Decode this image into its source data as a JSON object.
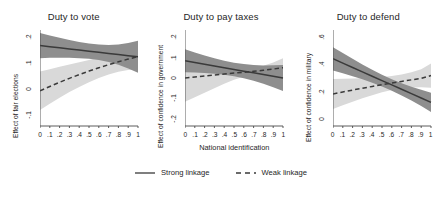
{
  "figure": {
    "xlabel": "National identification",
    "legend": [
      {
        "label": "Strong linkage",
        "style": "solid",
        "color": "#3a3a3a"
      },
      {
        "label": "Weak linkage",
        "style": "dashed",
        "color": "#3a3a3a"
      }
    ]
  },
  "colors": {
    "line": "#3a3a3a",
    "band_strong": "#8e8e8e",
    "band_weak": "#d9d9d9",
    "axis": "#4a4a4a",
    "text": "#262626"
  },
  "chart_data": [
    {
      "type": "line",
      "title": "Duty to vote",
      "xlabel": "",
      "ylabel": "Effect of fair elections",
      "x": [
        0,
        0.1,
        0.2,
        0.3,
        0.4,
        0.5,
        0.6,
        0.7,
        0.8,
        0.9,
        1
      ],
      "xticklabels": [
        "0",
        ".1",
        ".2",
        ".3",
        ".4",
        ".5",
        ".6",
        ".7",
        ".8",
        ".9",
        "1"
      ],
      "xlim": [
        0,
        1
      ],
      "ylim": [
        -0.14,
        0.225
      ],
      "yticks": [
        0.2,
        0.1,
        0,
        -0.1
      ],
      "yticklabels": [
        ".2",
        ".1",
        "0",
        "-.1"
      ],
      "grid": false,
      "series": [
        {
          "name": "Strong linkage",
          "style": "solid",
          "values": [
            0.166,
            0.1617,
            0.1574,
            0.1531,
            0.1488,
            0.1445,
            0.1402,
            0.1359,
            0.1316,
            0.1273,
            0.123
          ],
          "ci_lower": [
            0.118,
            0.1192,
            0.1196,
            0.1192,
            0.118,
            0.1155,
            0.111,
            0.1037,
            0.093,
            0.079,
            0.062
          ],
          "ci_upper": [
            0.214,
            0.2042,
            0.1952,
            0.187,
            0.1796,
            0.1735,
            0.1694,
            0.1681,
            0.1702,
            0.1756,
            0.184
          ]
        },
        {
          "name": "Weak linkage",
          "style": "dashed",
          "values": [
            -0.006,
            0.0104,
            0.0262,
            0.0412,
            0.0554,
            0.0688,
            0.0814,
            0.0932,
            0.1042,
            0.1144,
            0.1238
          ],
          "ci_lower": [
            -0.0795,
            -0.0554,
            -0.0326,
            -0.0112,
            0.0086,
            0.0266,
            0.0424,
            0.0558,
            0.0662,
            0.0732,
            0.0762
          ],
          "ci_upper": [
            0.0675,
            0.0762,
            0.085,
            0.0936,
            0.1022,
            0.111,
            0.1204,
            0.1306,
            0.1422,
            0.1556,
            0.1714
          ]
        }
      ]
    },
    {
      "type": "line",
      "title": "Duty to pay taxes",
      "xlabel": "National identification",
      "ylabel": "Effect of confidence in government",
      "x": [
        0,
        0.1,
        0.2,
        0.3,
        0.4,
        0.5,
        0.6,
        0.7,
        0.8,
        0.9,
        1
      ],
      "xticklabels": [
        "0",
        ".1",
        ".2",
        ".3",
        ".4",
        ".5",
        ".6",
        ".7",
        ".8",
        ".9",
        "1"
      ],
      "xlim": [
        0,
        1
      ],
      "ylim": [
        -0.235,
        0.235
      ],
      "yticks": [
        0.2,
        0.1,
        0,
        -0.1,
        -0.2
      ],
      "yticklabels": [
        ".2",
        ".1",
        "0",
        "-.1",
        "-.2"
      ],
      "grid": false,
      "series": [
        {
          "name": "Strong linkage",
          "style": "solid",
          "values": [
            0.084,
            0.0756,
            0.0672,
            0.0588,
            0.0504,
            0.042,
            0.0336,
            0.0252,
            0.0168,
            0.0084,
            0.0
          ],
          "ci_lower": [
            0.0276,
            0.0264,
            0.0242,
            0.0208,
            0.0158,
            0.0088,
            -0.0008,
            -0.0132,
            -0.0282,
            -0.0452,
            -0.0636
          ],
          "ci_upper": [
            0.1404,
            0.1248,
            0.1102,
            0.0968,
            0.085,
            0.0752,
            0.068,
            0.0636,
            0.0618,
            0.062,
            0.0636
          ]
        },
        {
          "name": "Weak linkage",
          "style": "dashed",
          "values": [
            0.0,
            0.0052,
            0.0102,
            0.015,
            0.0196,
            0.024,
            0.0282,
            0.0326,
            0.0378,
            0.0438,
            0.0504
          ],
          "ci_lower": [
            -0.1166,
            -0.0942,
            -0.0718,
            -0.0496,
            -0.0282,
            -0.0086,
            0.0064,
            0.0148,
            0.0162,
            0.0122,
            0.0046
          ],
          "ci_upper": [
            0.1166,
            0.1046,
            0.0922,
            0.0796,
            0.0674,
            0.0566,
            0.05,
            0.0504,
            0.0594,
            0.0754,
            0.0962
          ]
        }
      ]
    },
    {
      "type": "line",
      "title": "Duty to defend",
      "xlabel": "",
      "ylabel": "Effect of confidence in military",
      "x": [
        0,
        0.1,
        0.2,
        0.3,
        0.4,
        0.5,
        0.6,
        0.7,
        0.8,
        0.9,
        1
      ],
      "xticklabels": [
        "0",
        ".1",
        ".2",
        ".3",
        ".4",
        ".5",
        ".6",
        ".7",
        ".8",
        ".9",
        "1"
      ],
      "xlim": [
        0,
        1
      ],
      "ylim": [
        -0.055,
        0.655
      ],
      "yticks": [
        0.6,
        0.4,
        0.2,
        0
      ],
      "yticklabels": [
        ".6",
        ".4",
        ".2",
        "0"
      ],
      "grid": false,
      "series": [
        {
          "name": "Strong linkage",
          "style": "solid",
          "values": [
            0.442,
            0.4098,
            0.3776,
            0.3454,
            0.3132,
            0.281,
            0.2488,
            0.2166,
            0.1844,
            0.1522,
            0.12
          ],
          "ci_lower": [
            0.356,
            0.3352,
            0.3136,
            0.2906,
            0.2656,
            0.2378,
            0.2064,
            0.1712,
            0.1328,
            0.092,
            0.049
          ],
          "ci_upper": [
            0.528,
            0.4844,
            0.4416,
            0.4002,
            0.3608,
            0.3242,
            0.2912,
            0.262,
            0.236,
            0.2124,
            0.191
          ]
        },
        {
          "name": "Weak linkage",
          "style": "dashed",
          "values": [
            0.182,
            0.1966,
            0.2108,
            0.2244,
            0.2376,
            0.2504,
            0.2628,
            0.2748,
            0.2864,
            0.2976,
            0.318
          ],
          "ci_lower": [
            0.0715,
            0.0986,
            0.1248,
            0.1498,
            0.1732,
            0.1942,
            0.2116,
            0.2238,
            0.23,
            0.2308,
            0.228
          ],
          "ci_upper": [
            0.2925,
            0.2946,
            0.2968,
            0.299,
            0.302,
            0.3066,
            0.314,
            0.3258,
            0.3428,
            0.3644,
            0.408
          ]
        }
      ]
    }
  ]
}
